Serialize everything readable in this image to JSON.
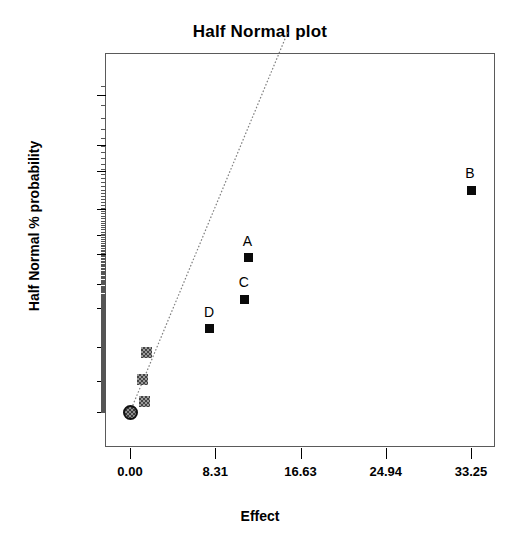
{
  "chart_data": {
    "type": "scatter",
    "title": "Half Normal plot",
    "xlabel": "Effect",
    "ylabel": "Half Normal % probability",
    "grid": false,
    "legend": "none",
    "xlim": [
      -1.5,
      38.0
    ],
    "ylim": [
      -12,
      99.8
    ],
    "xticks": [
      "0.00",
      "8.31",
      "16.63",
      "24.94",
      "33.25"
    ],
    "xtick_values": [
      0.0,
      8.31,
      16.63,
      24.94,
      33.25
    ],
    "yticks": [
      "0",
      "20",
      "40",
      "60",
      "70",
      "80",
      "85",
      "90",
      "95",
      "97",
      "99"
    ],
    "ytick_values": [
      0,
      20,
      40,
      60,
      70,
      80,
      85,
      90,
      95,
      97,
      99
    ],
    "reference_line": {
      "style": "dotted",
      "color": "#808080",
      "from": {
        "effect": 0.0,
        "probability": 0.0
      },
      "to": {
        "effect": 15.4,
        "probability": 99.8
      }
    },
    "points": [
      {
        "label": "",
        "effect": 0.0,
        "probability": 0.0,
        "marker": "circle-hatched",
        "significant": false
      },
      {
        "label": "",
        "effect": 1.45,
        "probability": 7.0,
        "marker": "square-hatched",
        "significant": false
      },
      {
        "label": "",
        "effect": 1.2,
        "probability": 21.0,
        "marker": "square-hatched",
        "significant": false
      },
      {
        "label": "",
        "effect": 1.62,
        "probability": 37.0,
        "marker": "square-hatched",
        "significant": false
      },
      {
        "label": "D",
        "effect": 7.8,
        "probability": 50.0,
        "marker": "square-filled",
        "significant": true
      },
      {
        "label": "C",
        "effect": 11.2,
        "probability": 64.0,
        "marker": "square-filled",
        "significant": true
      },
      {
        "label": "A",
        "effect": 11.55,
        "probability": 79.0,
        "marker": "square-filled",
        "significant": true
      },
      {
        "label": "B",
        "effect": 33.25,
        "probability": 92.8,
        "marker": "square-filled",
        "significant": true
      }
    ],
    "colors": {
      "significant_marker": "#0a0a0a",
      "non_significant_marker": "#9a9a9a",
      "reference_line": "#808080",
      "frame": "#5a5a5a",
      "text": "#000000"
    }
  }
}
